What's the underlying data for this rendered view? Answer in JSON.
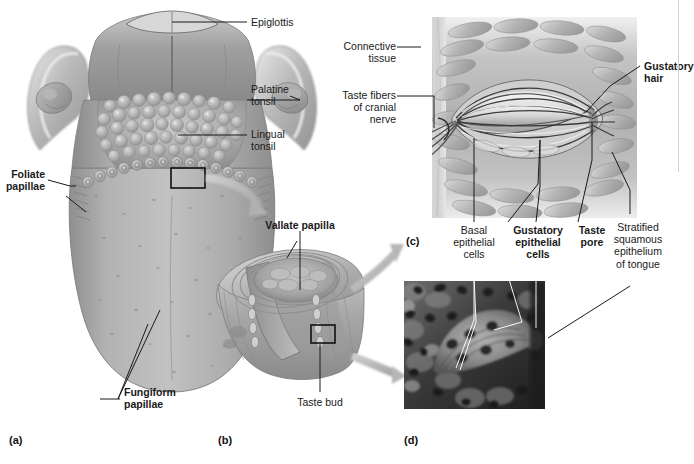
{
  "figure": {
    "background_color": "#ffffff",
    "ink_color": "#1a1a1a",
    "tissue_gray": "#a8a8a8"
  },
  "panels": [
    {
      "id": "a",
      "letter": "(a)",
      "caption": "Superior view of the tongue showing papillae and tonsils"
    },
    {
      "id": "b",
      "letter": "(b)",
      "caption": "Sectional view of a vallate papilla"
    },
    {
      "id": "c",
      "letter": "(c)",
      "caption": "Enlarged view of a taste bud"
    },
    {
      "id": "d",
      "letter": "(d)",
      "caption": "Photomicrograph of a taste bud"
    }
  ],
  "labels": {
    "epiglottis": "Epiglottis",
    "palatine_tonsil": "Palatine\ntonsil",
    "lingual_tonsil": "Lingual\ntonsil",
    "foliate_papillae": "Foliate\npapillae",
    "fungiform_papillae": "Fungiform\npapillae",
    "vallate_papilla": "Vallate papilla",
    "taste_bud": "Taste bud",
    "connective_tissue": "Connective\ntissue",
    "taste_fibers": "Taste fibers\nof cranial\nnerve",
    "gustatory_hair": "Gustatory\nhair",
    "basal_epithelial_cells": "Basal\nepithelial\ncells",
    "gustatory_epithelial_cells": "Gustatory\nepithelial\ncells",
    "taste_pore": "Taste\npore",
    "stratified_squamous": "Stratified\nsquamous\nepithelium\nof tongue"
  },
  "label_styles": {
    "epiglottis": "regular",
    "palatine_tonsil": "regular",
    "lingual_tonsil": "regular",
    "foliate_papillae": "bold",
    "fungiform_papillae": "bold",
    "vallate_papilla": "bold",
    "taste_bud": "regular",
    "connective_tissue": "regular",
    "taste_fibers": "regular",
    "gustatory_hair": "bold",
    "basal_epithelial_cells": "regular",
    "gustatory_epithelial_cells": "bold",
    "taste_pore": "bold",
    "stratified_squamous": "regular"
  }
}
